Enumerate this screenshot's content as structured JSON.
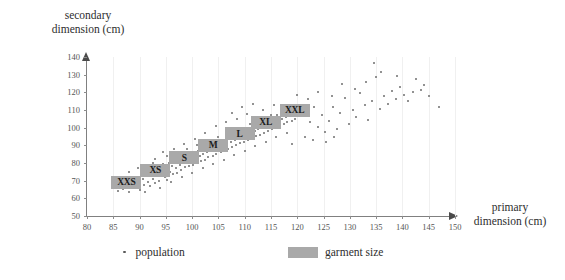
{
  "chart_data": {
    "type": "scatter",
    "title": "",
    "xlabel": "primary\ndimension (cm)",
    "ylabel": "secondary\ndimension (cm)",
    "xlim": [
      80,
      150
    ],
    "ylim": [
      50,
      140
    ],
    "xticks": [
      80,
      85,
      90,
      95,
      100,
      105,
      110,
      115,
      120,
      125,
      130,
      135,
      140,
      145,
      150
    ],
    "yticks": [
      50,
      60,
      70,
      80,
      90,
      100,
      110,
      120,
      130,
      140
    ],
    "grid": "vertical",
    "legend_position": "bottom",
    "legend": [
      {
        "label": "population",
        "marker": "dot",
        "color": "#6e6e6e"
      },
      {
        "label": "garment size",
        "marker": "swatch",
        "color": "#a9a9a9"
      }
    ],
    "series": [
      {
        "name": "population",
        "marker": "dot",
        "color": "#6e6e6e",
        "points": [
          [
            85.1,
            66.5
          ],
          [
            85.8,
            64.2
          ],
          [
            86.4,
            68.0
          ],
          [
            86.9,
            65.1
          ],
          [
            87.2,
            70.3
          ],
          [
            87.6,
            67.4
          ],
          [
            88.0,
            63.8
          ],
          [
            88.3,
            69.6
          ],
          [
            88.7,
            72.0
          ],
          [
            89.0,
            66.2
          ],
          [
            89.4,
            70.9
          ],
          [
            89.8,
            68.3
          ],
          [
            90.1,
            65.0
          ],
          [
            90.3,
            73.1
          ],
          [
            90.6,
            71.2
          ],
          [
            90.9,
            67.8
          ],
          [
            91.2,
            74.5
          ],
          [
            91.5,
            69.0
          ],
          [
            91.8,
            72.6
          ],
          [
            92.0,
            66.9
          ],
          [
            92.3,
            75.4
          ],
          [
            92.6,
            71.0
          ],
          [
            92.9,
            68.5
          ],
          [
            93.1,
            76.2
          ],
          [
            93.4,
            73.3
          ],
          [
            93.7,
            70.1
          ],
          [
            94.0,
            77.0
          ],
          [
            94.2,
            74.0
          ],
          [
            94.5,
            79.4
          ],
          [
            94.8,
            72.2
          ],
          [
            95.0,
            76.8
          ],
          [
            95.3,
            70.5
          ],
          [
            95.6,
            80.1
          ],
          [
            95.8,
            75.0
          ],
          [
            96.1,
            78.3
          ],
          [
            96.4,
            73.6
          ],
          [
            96.6,
            81.0
          ],
          [
            96.9,
            77.2
          ],
          [
            97.1,
            74.4
          ],
          [
            97.4,
            82.0
          ],
          [
            97.6,
            79.0
          ],
          [
            97.9,
            76.0
          ],
          [
            98.1,
            83.2
          ],
          [
            98.4,
            80.4
          ],
          [
            98.6,
            77.5
          ],
          [
            98.9,
            84.1
          ],
          [
            99.1,
            81.0
          ],
          [
            99.4,
            78.2
          ],
          [
            99.6,
            85.0
          ],
          [
            99.9,
            82.3
          ],
          [
            100.1,
            79.1
          ],
          [
            100.4,
            86.2
          ],
          [
            100.6,
            83.0
          ],
          [
            100.9,
            80.0
          ],
          [
            101.1,
            87.0
          ],
          [
            101.4,
            84.2
          ],
          [
            101.6,
            81.3
          ],
          [
            101.9,
            88.1
          ],
          [
            102.1,
            85.0
          ],
          [
            102.4,
            82.0
          ],
          [
            102.6,
            89.0
          ],
          [
            102.9,
            86.1
          ],
          [
            103.1,
            83.2
          ],
          [
            103.4,
            90.0
          ],
          [
            103.6,
            87.0
          ],
          [
            103.9,
            84.1
          ],
          [
            104.1,
            91.2
          ],
          [
            104.4,
            88.0
          ],
          [
            104.6,
            85.0
          ],
          [
            104.9,
            92.0
          ],
          [
            105.1,
            89.1
          ],
          [
            105.4,
            86.2
          ],
          [
            105.6,
            93.0
          ],
          [
            105.9,
            90.0
          ],
          [
            106.1,
            87.1
          ],
          [
            106.4,
            94.1
          ],
          [
            106.6,
            91.0
          ],
          [
            106.9,
            88.0
          ],
          [
            107.1,
            95.0
          ],
          [
            107.4,
            92.1
          ],
          [
            107.6,
            89.2
          ],
          [
            107.9,
            96.0
          ],
          [
            108.1,
            93.0
          ],
          [
            108.4,
            90.0
          ],
          [
            108.6,
            97.1
          ],
          [
            108.9,
            94.0
          ],
          [
            109.1,
            91.1
          ],
          [
            109.4,
            98.0
          ],
          [
            109.6,
            95.0
          ],
          [
            109.9,
            92.0
          ],
          [
            110.1,
            99.1
          ],
          [
            110.4,
            96.0
          ],
          [
            110.6,
            93.0
          ],
          [
            110.9,
            100.0
          ],
          [
            111.1,
            97.1
          ],
          [
            111.4,
            94.0
          ],
          [
            111.6,
            101.0
          ],
          [
            111.9,
            98.0
          ],
          [
            112.1,
            95.1
          ],
          [
            112.4,
            102.0
          ],
          [
            112.6,
            99.0
          ],
          [
            112.9,
            96.0
          ],
          [
            113.1,
            103.1
          ],
          [
            113.4,
            100.0
          ],
          [
            113.6,
            97.0
          ],
          [
            113.9,
            104.0
          ],
          [
            114.1,
            101.1
          ],
          [
            114.4,
            98.0
          ],
          [
            114.6,
            105.0
          ],
          [
            114.9,
            102.0
          ],
          [
            115.1,
            99.1
          ],
          [
            115.4,
            106.0
          ],
          [
            115.6,
            103.0
          ],
          [
            115.9,
            100.0
          ],
          [
            116.1,
            107.1
          ],
          [
            116.4,
            104.0
          ],
          [
            116.6,
            101.0
          ],
          [
            116.9,
            108.0
          ],
          [
            117.1,
            105.1
          ],
          [
            117.4,
            102.0
          ],
          [
            117.6,
            109.0
          ],
          [
            117.9,
            106.0
          ],
          [
            118.1,
            103.1
          ],
          [
            118.4,
            110.0
          ],
          [
            118.6,
            107.0
          ],
          [
            118.9,
            104.0
          ],
          [
            119.1,
            111.1
          ],
          [
            119.4,
            108.0
          ],
          [
            119.6,
            105.0
          ],
          [
            119.9,
            112.0
          ],
          [
            86.2,
            71.5
          ],
          [
            87.9,
            74.8
          ],
          [
            89.6,
            77.0
          ],
          [
            91.0,
            63.5
          ],
          [
            92.5,
            79.8
          ],
          [
            93.9,
            66.0
          ],
          [
            95.2,
            84.0
          ],
          [
            96.0,
            69.0
          ],
          [
            97.0,
            86.5
          ],
          [
            98.0,
            72.0
          ],
          [
            99.0,
            88.0
          ],
          [
            100.0,
            74.5
          ],
          [
            101.0,
            90.5
          ],
          [
            102.0,
            77.0
          ],
          [
            103.0,
            92.5
          ],
          [
            104.0,
            79.5
          ],
          [
            105.0,
            94.5
          ],
          [
            106.0,
            82.0
          ],
          [
            107.0,
            97.0
          ],
          [
            108.0,
            84.5
          ],
          [
            109.0,
            99.5
          ],
          [
            110.0,
            87.0
          ],
          [
            111.0,
            102.0
          ],
          [
            112.0,
            89.5
          ],
          [
            113.0,
            104.0
          ],
          [
            114.0,
            92.0
          ],
          [
            115.0,
            107.0
          ],
          [
            116.0,
            94.5
          ],
          [
            117.0,
            109.0
          ],
          [
            118.0,
            97.0
          ],
          [
            104.5,
            101.0
          ],
          [
            106.5,
            103.5
          ],
          [
            108.5,
            105.0
          ],
          [
            110.5,
            108.0
          ],
          [
            102.5,
            97.0
          ],
          [
            100.5,
            93.5
          ],
          [
            98.5,
            91.0
          ],
          [
            96.5,
            88.0
          ],
          [
            94.5,
            86.0
          ],
          [
            93.0,
            82.5
          ],
          [
            109.5,
            112.0
          ],
          [
            111.5,
            113.5
          ],
          [
            113.5,
            110.0
          ],
          [
            115.5,
            113.0
          ],
          [
            107.5,
            108.5
          ],
          [
            120.4,
            113.0
          ],
          [
            121.0,
            106.5
          ],
          [
            121.8,
            109.0
          ],
          [
            122.5,
            103.0
          ],
          [
            123.1,
            111.5
          ],
          [
            123.9,
            100.5
          ],
          [
            124.6,
            107.0
          ],
          [
            125.2,
            97.5
          ],
          [
            126.0,
            104.0
          ],
          [
            126.8,
            112.0
          ],
          [
            127.5,
            99.0
          ],
          [
            128.2,
            108.5
          ],
          [
            129.0,
            117.0
          ],
          [
            129.8,
            102.0
          ],
          [
            130.5,
            110.0
          ],
          [
            131.2,
            106.0
          ],
          [
            132.0,
            119.5
          ],
          [
            132.8,
            113.0
          ],
          [
            133.5,
            104.5
          ],
          [
            134.2,
            115.0
          ],
          [
            135.0,
            128.5
          ],
          [
            135.8,
            110.5
          ],
          [
            136.5,
            118.0
          ],
          [
            137.2,
            113.5
          ],
          [
            138.0,
            121.0
          ],
          [
            138.8,
            116.0
          ],
          [
            139.5,
            123.0
          ],
          [
            140.2,
            118.5
          ],
          [
            141.0,
            115.0
          ],
          [
            142.0,
            120.0
          ],
          [
            143.5,
            121.5
          ],
          [
            145.0,
            118.0
          ],
          [
            147.0,
            112.0
          ],
          [
            128.5,
            125.0
          ],
          [
            131.0,
            122.0
          ],
          [
            120.0,
            118.5
          ],
          [
            122.0,
            116.0
          ],
          [
            124.0,
            120.5
          ],
          [
            126.5,
            118.0
          ],
          [
            133.0,
            126.0
          ],
          [
            136.0,
            131.5
          ],
          [
            139.0,
            129.0
          ],
          [
            142.5,
            127.5
          ],
          [
            144.0,
            124.0
          ],
          [
            134.5,
            136.5
          ],
          [
            121.5,
            95.0
          ],
          [
            123.0,
            93.0
          ],
          [
            125.5,
            92.0
          ],
          [
            127.0,
            94.5
          ],
          [
            119.0,
            91.0
          ]
        ]
      }
    ],
    "garment_sizes": [
      {
        "label": "XXS",
        "x": 87.5,
        "y": 69.0
      },
      {
        "label": "XS",
        "x": 93.0,
        "y": 76.0
      },
      {
        "label": "S",
        "x": 98.5,
        "y": 83.0
      },
      {
        "label": "M",
        "x": 104.0,
        "y": 90.0
      },
      {
        "label": "L",
        "x": 109.0,
        "y": 96.5
      },
      {
        "label": "XL",
        "x": 114.0,
        "y": 103.0
      },
      {
        "label": "XXL",
        "x": 119.5,
        "y": 110.0
      }
    ]
  }
}
